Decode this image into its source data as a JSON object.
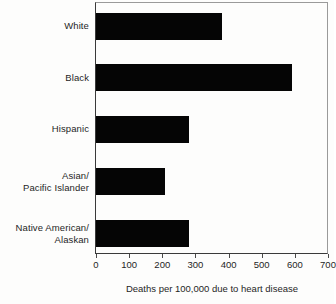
{
  "chart_data": {
    "type": "bar",
    "orientation": "horizontal",
    "title": "",
    "subtitle": "",
    "xlabel": "Deaths per 100,000 due to heart disease",
    "ylabel": "",
    "categories": [
      "White",
      "Black",
      "Hispanic",
      "Asian/ Pacific Islander",
      "Native American/ Alaskan"
    ],
    "category_lines": [
      [
        "White"
      ],
      [
        "Black"
      ],
      [
        "Hispanic"
      ],
      [
        "Asian/",
        "Pacific Islander"
      ],
      [
        "Native American/",
        "Alaskan"
      ]
    ],
    "values": [
      380,
      590,
      280,
      207,
      280
    ],
    "xlim": [
      0,
      700
    ],
    "xticks": [
      0,
      100,
      200,
      300,
      400,
      500,
      600,
      700
    ],
    "xtick_labels": [
      "0",
      "100",
      "200",
      "300",
      "400",
      "500",
      "600",
      "700"
    ],
    "grid": false,
    "legend": null,
    "bar_color": "#050505",
    "axis_color": "#3a3a3a",
    "background": "#fdfdfc"
  }
}
